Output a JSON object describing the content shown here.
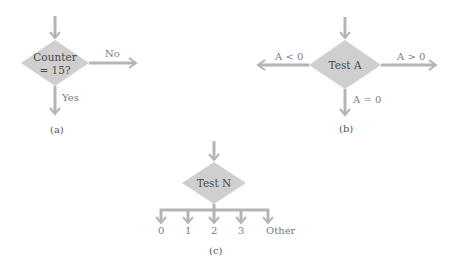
{
  "diagram_a": {
    "decision": {
      "line1": "Counter",
      "line2": "= 15?"
    },
    "branch_no": "No",
    "branch_yes": "Yes",
    "caption": "(a)"
  },
  "diagram_b": {
    "decision": "Test A",
    "branch_left": "A < 0",
    "branch_right": "A > 0",
    "branch_down": "A = 0",
    "caption": "(b)"
  },
  "diagram_c": {
    "decision": "Test N",
    "branches": [
      "0",
      "1",
      "2",
      "3",
      "Other"
    ],
    "caption": "(c)"
  },
  "colors": {
    "diamond": "#cfcfcf",
    "arrow": "#b4b4b4",
    "label": "#7a7a7a"
  }
}
